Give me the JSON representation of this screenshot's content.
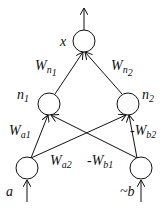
{
  "diagram": {
    "type": "neural-network",
    "nodes": [
      {
        "id": "x",
        "label": "x",
        "cx": 84,
        "cy": 41
      },
      {
        "id": "n1",
        "label": "n",
        "sub": "1",
        "cx": 49,
        "cy": 104
      },
      {
        "id": "n2",
        "label": "n",
        "sub": "2",
        "cx": 128,
        "cy": 104
      },
      {
        "id": "a",
        "label": "a",
        "cx": 27,
        "cy": 168
      },
      {
        "id": "nb",
        "label": "~b",
        "cx": 141,
        "cy": 168
      }
    ],
    "edges": [
      {
        "from": "n1",
        "to": "x",
        "label": "W",
        "sub": "n1"
      },
      {
        "from": "n2",
        "to": "x",
        "label": "W",
        "sub": "n2"
      },
      {
        "from": "a",
        "to": "n1",
        "label": "W",
        "sub": "a1"
      },
      {
        "from": "a",
        "to": "n2",
        "label": "W",
        "sub": "a2"
      },
      {
        "from": "nb",
        "to": "n1",
        "label": "-W",
        "sub": "b1"
      },
      {
        "from": "nb",
        "to": "n2",
        "label": "-W",
        "sub": "b2"
      }
    ],
    "labels": {
      "x": "x",
      "n1": "n",
      "n1_sub": "1",
      "n2": "n",
      "n2_sub": "2",
      "a": "a",
      "nb": "~b",
      "wn1": "W",
      "wn1_sub": "n",
      "wn1_subsub": "1",
      "wn2": "W",
      "wn2_sub": "n",
      "wn2_subsub": "2",
      "wa1": "W",
      "wa1_sub": "a1",
      "wa2": "W",
      "wa2_sub": "a2",
      "wb1": "-W",
      "wb1_sub": "b1",
      "wb2": "-W",
      "wb2_sub": "b2"
    }
  }
}
